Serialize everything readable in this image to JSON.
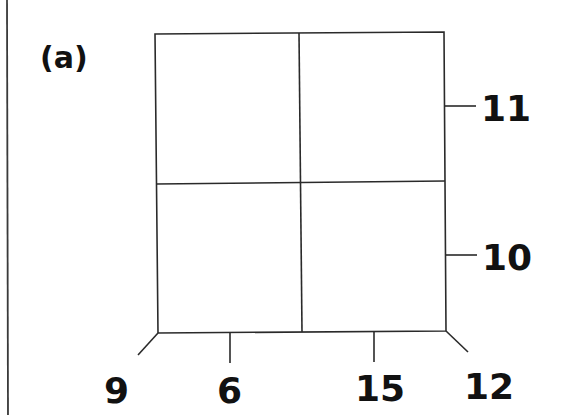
{
  "panel": {
    "label": "(a)"
  },
  "grid": {
    "rows": 2,
    "cols": 2,
    "stroke_color": "#2a2a2a"
  },
  "labels": {
    "right_upper": "11",
    "right_lower": "10",
    "bottom_far_left": "9",
    "bottom_left": "6",
    "bottom_right": "15",
    "bottom_far_right": "12"
  }
}
